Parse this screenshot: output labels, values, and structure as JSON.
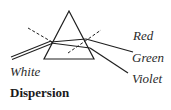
{
  "diagram": {
    "title": "Dispersion",
    "incident_label": "White",
    "output_labels": {
      "red": "Red",
      "green": "Green",
      "violet": "Violet"
    },
    "prism": {
      "apex": [
        69,
        11
      ],
      "base_left": [
        44,
        59
      ],
      "base_right": [
        94,
        59
      ]
    },
    "colors": {
      "stroke": "#1f1f1f",
      "text": "#2a2a2a"
    }
  }
}
